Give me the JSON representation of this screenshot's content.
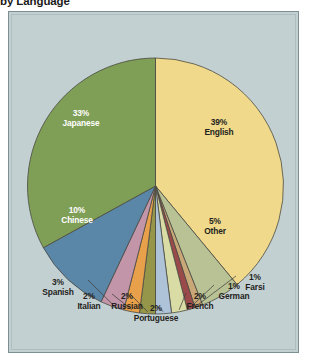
{
  "title": "by Language",
  "colors": {
    "background": "#c3d0d2",
    "frame_border": "#7d8f93",
    "pie_outline": "#4a4a42",
    "leader_line": "#3a3a3a",
    "label_dark": "#231f20",
    "label_light": "#ffffff"
  },
  "chart_data": {
    "type": "pie",
    "title": "by Language",
    "xlabel": "",
    "ylabel": "",
    "legend_position": "none",
    "grid": false,
    "categories": [
      "English",
      "Japanese",
      "Chinese",
      "Other",
      "Spanish",
      "Italian",
      "Russian",
      "Portuguese",
      "French",
      "German",
      "Farsi"
    ],
    "values": [
      39,
      33,
      10,
      5,
      3,
      2,
      2,
      2,
      2,
      1,
      1
    ],
    "unit": "%",
    "slices": [
      {
        "name": "English",
        "value": 39,
        "pct_label": "39%",
        "color": "#f0d98a",
        "label_mode": "inside",
        "text": "dark"
      },
      {
        "name": "Other",
        "value": 5,
        "pct_label": "5%",
        "color": "#b9c295",
        "label_mode": "inside",
        "text": "dark"
      },
      {
        "name": "Farsi",
        "value": 1,
        "pct_label": "1%",
        "color": "#c9a878",
        "label_mode": "leader",
        "text": "dark"
      },
      {
        "name": "German",
        "value": 1,
        "pct_label": "1%",
        "color": "#9b4a4a",
        "label_mode": "leader",
        "text": "dark"
      },
      {
        "name": "French",
        "value": 2,
        "pct_label": "2%",
        "color": "#d9dca4",
        "label_mode": "leader",
        "text": "dark"
      },
      {
        "name": "Portuguese",
        "value": 2,
        "pct_label": "2%",
        "color": "#aec3d8",
        "label_mode": "leader",
        "text": "dark"
      },
      {
        "name": "Russian",
        "value": 2,
        "pct_label": "2%",
        "color": "#96964a",
        "label_mode": "leader",
        "text": "dark"
      },
      {
        "name": "Italian",
        "value": 2,
        "pct_label": "2%",
        "color": "#e8a04a",
        "label_mode": "leader",
        "text": "dark"
      },
      {
        "name": "Spanish",
        "value": 3,
        "pct_label": "3%",
        "color": "#c295a8",
        "label_mode": "leader",
        "text": "dark"
      },
      {
        "name": "Chinese",
        "value": 10,
        "pct_label": "10%",
        "color": "#5a86a8",
        "label_mode": "inside",
        "text": "light"
      },
      {
        "name": "Japanese",
        "value": 33,
        "pct_label": "33%",
        "color": "#7f9e56",
        "label_mode": "inside",
        "text": "light"
      }
    ]
  },
  "labels": {
    "english": {
      "pct": "39%",
      "name": "English"
    },
    "japanese": {
      "pct": "33%",
      "name": "Japanese"
    },
    "chinese": {
      "pct": "10%",
      "name": "Chinese"
    },
    "other": {
      "pct": "5%",
      "name": "Other"
    },
    "spanish": {
      "pct": "3%",
      "name": "Spanish"
    },
    "italian": {
      "pct": "2%",
      "name": "Italian"
    },
    "russian": {
      "pct": "2%",
      "name": "Russian"
    },
    "portuguese": {
      "pct": "2%",
      "name": "Portuguese"
    },
    "french": {
      "pct": "2%",
      "name": "French"
    },
    "german": {
      "pct": "1%",
      "name": "German"
    },
    "farsi": {
      "pct": "1%",
      "name": "Farsi"
    }
  }
}
